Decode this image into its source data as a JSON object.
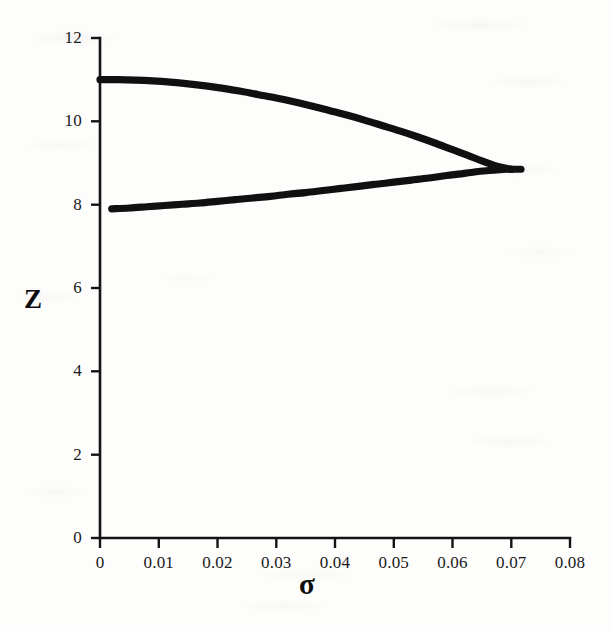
{
  "figure": {
    "kind": "scanned-book-figure",
    "background_color": "#fdfdfc",
    "ink_color": "#101010"
  },
  "chart_data": {
    "type": "line",
    "title": "",
    "subtitle": "",
    "xlabel": "σ",
    "ylabel": "Z",
    "xlim": [
      0,
      0.08
    ],
    "ylim": [
      0,
      12
    ],
    "grid": false,
    "legend": null,
    "xticks": [
      0,
      0.01,
      0.02,
      0.03,
      0.04,
      0.05,
      0.06,
      0.07,
      0.08
    ],
    "xtick_labels": [
      "0",
      "0.01",
      "0.02",
      "0.03",
      "0.04",
      "0.05",
      "0.06",
      "0.07",
      "0.08"
    ],
    "yticks": [
      0,
      2,
      4,
      6,
      8,
      10,
      12
    ],
    "ytick_labels": [
      "0",
      "2",
      "4",
      "6",
      "8",
      "10",
      "12"
    ],
    "annotations": [],
    "series": [
      {
        "name": "upper-branch",
        "description": "upper solution branch descending from Z=11 at sigma=0 to the fold point",
        "x": [
          0.0,
          0.003,
          0.006,
          0.009,
          0.012,
          0.015,
          0.018,
          0.021,
          0.024,
          0.027,
          0.03,
          0.033,
          0.036,
          0.039,
          0.042,
          0.045,
          0.048,
          0.051,
          0.054,
          0.057,
          0.06,
          0.0625,
          0.065,
          0.067,
          0.0685,
          0.0695,
          0.07
        ],
        "y": [
          11.0,
          11.0,
          10.99,
          10.97,
          10.94,
          10.9,
          10.85,
          10.79,
          10.72,
          10.64,
          10.56,
          10.47,
          10.37,
          10.26,
          10.15,
          10.03,
          9.9,
          9.77,
          9.63,
          9.48,
          9.32,
          9.19,
          9.05,
          8.95,
          8.89,
          8.86,
          8.85
        ]
      },
      {
        "name": "lower-branch",
        "description": "lower solution branch rising from Z=7.9 at sigma=0.002 to the fold point",
        "x": [
          0.002,
          0.005,
          0.008,
          0.011,
          0.014,
          0.017,
          0.02,
          0.023,
          0.026,
          0.029,
          0.032,
          0.035,
          0.038,
          0.041,
          0.044,
          0.047,
          0.05,
          0.053,
          0.056,
          0.059,
          0.0615,
          0.064,
          0.0662,
          0.068,
          0.0692,
          0.0698,
          0.07
        ],
        "y": [
          7.9,
          7.92,
          7.95,
          7.98,
          8.01,
          8.04,
          8.08,
          8.12,
          8.16,
          8.2,
          8.25,
          8.29,
          8.34,
          8.39,
          8.44,
          8.49,
          8.54,
          8.59,
          8.64,
          8.7,
          8.74,
          8.79,
          8.82,
          8.84,
          8.85,
          8.85,
          8.85
        ]
      }
    ],
    "fold_point": {
      "x": 0.07,
      "y": 8.85
    }
  }
}
